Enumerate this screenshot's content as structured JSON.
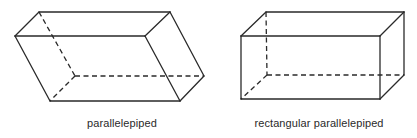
{
  "figures": [
    {
      "id": "parallelepiped",
      "label": "parallelepiped",
      "label_center_x": 122,
      "vertices": {
        "back_top_left": [
          39,
          12
        ],
        "back_top_right": [
          170,
          12
        ],
        "front_top_left": [
          15,
          36
        ],
        "front_top_right": [
          145,
          36
        ],
        "back_bottom_left": [
          75,
          76
        ],
        "back_bottom_right": [
          204,
          76
        ],
        "front_bottom_left": [
          50,
          101
        ],
        "front_bottom_right": [
          180,
          101
        ]
      }
    },
    {
      "id": "rectangular-parallelepiped",
      "label": "rectangular  parallelepiped",
      "label_center_x": 319,
      "vertices": {
        "back_top_left": [
          266,
          12
        ],
        "back_top_right": [
          404,
          12
        ],
        "front_top_left": [
          241,
          36
        ],
        "front_top_right": [
          380,
          36
        ],
        "back_bottom_left": [
          267,
          75
        ],
        "back_bottom_right": [
          404,
          75
        ],
        "front_bottom_left": [
          241,
          99
        ],
        "front_bottom_right": [
          380,
          99
        ]
      }
    }
  ],
  "colors": {
    "line": "#2a2a2a",
    "background": "#ffffff"
  }
}
